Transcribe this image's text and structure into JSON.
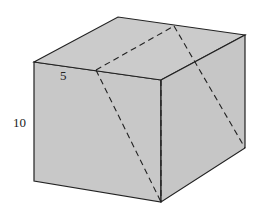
{
  "diagram": {
    "type": "rectangular-prism",
    "labels": {
      "depth": "5",
      "height": "10"
    },
    "colors": {
      "face": "#c8c8c8",
      "edge": "#222222",
      "background": "#ffffff"
    }
  }
}
